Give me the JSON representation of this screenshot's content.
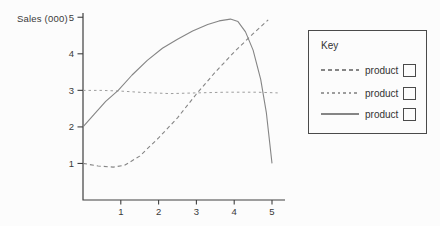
{
  "figure": {
    "ylabel": "Sales (000)"
  },
  "legend": {
    "title": "Key",
    "entries": [
      {
        "label": "product",
        "style": "dashed"
      },
      {
        "label": "product",
        "style": "fine-dashed"
      },
      {
        "label": "product",
        "style": "solid"
      }
    ]
  },
  "colors": {
    "axis": "#3f3f3f",
    "tick_text": "#3a3a3a",
    "line_gray": "#858585",
    "line_light_gray": "#9d9d9d",
    "legend_border": "#4a4a4a"
  },
  "chart_data": {
    "type": "line",
    "title": "",
    "xlabel": "",
    "ylabel": "Sales (000)",
    "xlim": [
      0,
      5.35
    ],
    "ylim": [
      0,
      5.15
    ],
    "xticks": [
      1,
      2,
      3,
      4,
      5
    ],
    "yticks": [
      1,
      2,
      3,
      4,
      5
    ],
    "grid": false,
    "legend_position": "right-outside-box",
    "series": [
      {
        "name": "product (rising dashed line)",
        "style": "dashed",
        "points": [
          [
            0,
            1.0
          ],
          [
            0.4,
            0.93
          ],
          [
            0.8,
            0.9
          ],
          [
            1.1,
            0.95
          ],
          [
            1.5,
            1.2
          ],
          [
            2,
            1.7
          ],
          [
            2.5,
            2.25
          ],
          [
            3,
            2.9
          ],
          [
            3.5,
            3.5
          ],
          [
            4,
            4.05
          ],
          [
            4.5,
            4.55
          ],
          [
            4.9,
            4.93
          ]
        ]
      },
      {
        "name": "product (flat fine-dashed line at ~3)",
        "style": "fine-dashed",
        "points": [
          [
            0,
            3.0
          ],
          [
            0.5,
            3.0
          ],
          [
            1,
            2.98
          ],
          [
            1.6,
            2.94
          ],
          [
            2.3,
            2.91
          ],
          [
            3,
            2.93
          ],
          [
            3.8,
            2.95
          ],
          [
            4.6,
            2.95
          ],
          [
            5.15,
            2.93
          ]
        ]
      },
      {
        "name": "product (solid rise-and-fall curve)",
        "style": "solid",
        "points": [
          [
            0,
            2.0
          ],
          [
            0.3,
            2.35
          ],
          [
            0.6,
            2.7
          ],
          [
            0.93,
            3.0
          ],
          [
            1.3,
            3.42
          ],
          [
            1.7,
            3.82
          ],
          [
            2.1,
            4.15
          ],
          [
            2.5,
            4.4
          ],
          [
            2.9,
            4.62
          ],
          [
            3.3,
            4.8
          ],
          [
            3.6,
            4.9
          ],
          [
            3.9,
            4.95
          ],
          [
            4.1,
            4.88
          ],
          [
            4.3,
            4.6
          ],
          [
            4.5,
            4.1
          ],
          [
            4.7,
            3.3
          ],
          [
            4.85,
            2.4
          ],
          [
            5.0,
            1.0
          ]
        ]
      }
    ]
  }
}
